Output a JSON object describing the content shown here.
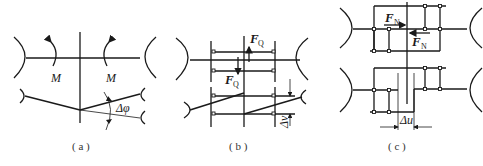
{
  "figure": {
    "panels": [
      {
        "id": "a",
        "caption": "( a )",
        "description": "Bending deformation: moment M applied, relative rotation angle",
        "labels": {
          "moment_left": "M",
          "moment_right": "M",
          "angle": "Δφ"
        }
      },
      {
        "id": "b",
        "caption": "( b )",
        "description": "Shear deformation: shear force FQ, relative displacement",
        "labels": {
          "force_top": "F",
          "force_top_sub": "Q",
          "force_bottom": "F",
          "force_bottom_sub": "Q",
          "displacement": "Δv"
        }
      },
      {
        "id": "c",
        "caption": "( c )",
        "description": "Axial deformation: normal force FN, relative displacement",
        "labels": {
          "force_top": "F",
          "force_top_sub": "N",
          "force_bottom": "F",
          "force_bottom_sub": "N",
          "displacement": "Δu"
        }
      }
    ]
  }
}
